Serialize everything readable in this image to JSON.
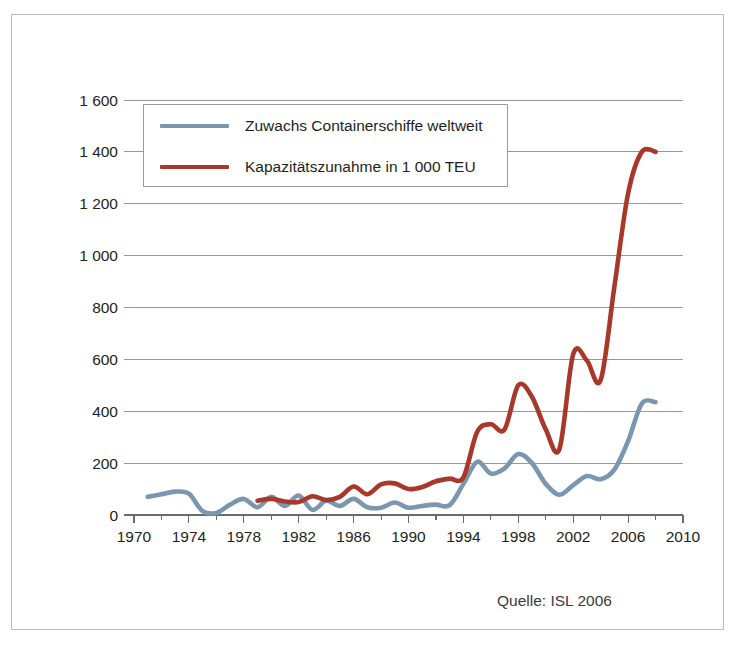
{
  "figure": {
    "source_note": "Quelle: ISL 2006",
    "background_color": "#ffffff",
    "frame_color": "#b9b9b9"
  },
  "legend": {
    "position": "inside-top-left",
    "entries": [
      {
        "label": "Zuwachs Containerschiffe weltweit",
        "color": "#7a96b0"
      },
      {
        "label": "Kapazitätszunahme in 1 000 TEU",
        "color": "#a8382a"
      }
    ]
  },
  "chart_data": {
    "type": "line",
    "title": "",
    "subtitle": "",
    "xlabel": "",
    "ylabel": "",
    "xlim": [
      1970,
      2010
    ],
    "ylim": [
      0,
      1600
    ],
    "grid": true,
    "legend_position": "inside-top-left",
    "xticks": [
      "1970",
      "1974",
      "1978",
      "1982",
      "1986",
      "1990",
      "1994",
      "1998",
      "2002",
      "2006",
      "2010"
    ],
    "xtick_values": [
      1970,
      1974,
      1978,
      1982,
      1986,
      1990,
      1994,
      1998,
      2002,
      2006,
      2010
    ],
    "yticks": [
      "0",
      "200",
      "400",
      "600",
      "800",
      "1 000",
      "1 200",
      "1 400",
      "1 600"
    ],
    "ytick_values": [
      0,
      200,
      400,
      600,
      800,
      1000,
      1200,
      1400,
      1600
    ],
    "x": [
      1971,
      1972,
      1973,
      1974,
      1975,
      1976,
      1977,
      1978,
      1979,
      1980,
      1981,
      1982,
      1983,
      1984,
      1985,
      1986,
      1987,
      1988,
      1989,
      1990,
      1991,
      1992,
      1993,
      1994,
      1995,
      1996,
      1997,
      1998,
      1999,
      2000,
      2001,
      2002,
      2003,
      2004,
      2005,
      2006,
      2007,
      2008
    ],
    "series": [
      {
        "name": "Zuwachs Containerschiffe weltweit",
        "color": "#7a96b0",
        "unit": "Schiffe",
        "values": [
          70,
          80,
          90,
          82,
          15,
          8,
          40,
          62,
          30,
          70,
          35,
          75,
          20,
          55,
          35,
          62,
          30,
          28,
          48,
          28,
          35,
          40,
          38,
          120,
          205,
          160,
          180,
          235,
          200,
          120,
          78,
          115,
          150,
          138,
          175,
          285,
          430,
          435
        ]
      },
      {
        "name": "Kapazitätszunahme in 1 000 TEU",
        "color": "#a8382a",
        "unit": "1 000 TEU",
        "values": [
          null,
          null,
          null,
          null,
          null,
          null,
          null,
          null,
          55,
          62,
          52,
          50,
          72,
          58,
          70,
          110,
          80,
          118,
          122,
          100,
          108,
          130,
          140,
          145,
          320,
          350,
          330,
          500,
          455,
          330,
          255,
          620,
          595,
          520,
          880,
          1240,
          1400,
          1400
        ]
      }
    ]
  }
}
